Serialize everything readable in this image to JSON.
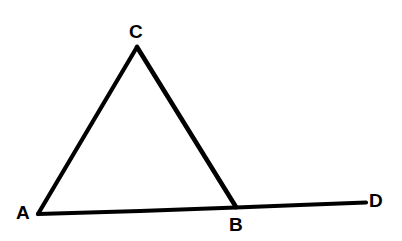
{
  "figure": {
    "background_color": "#ffffff",
    "stroke_color": "#000000",
    "stroke_width": 4,
    "width": 402,
    "height": 241
  },
  "labels": {
    "A": "A",
    "B": "B",
    "C": "C",
    "D": "D"
  },
  "geometry": {
    "points": [
      {
        "name": "A",
        "x": 38,
        "y": 214,
        "label_x": 24,
        "label_y": 212
      },
      {
        "name": "C",
        "x": 137,
        "y": 47,
        "label_x": 136,
        "label_y": 31
      },
      {
        "name": "B",
        "x": 236,
        "y": 207,
        "label_x": 236,
        "label_y": 224
      },
      {
        "name": "D",
        "x": 366,
        "y": 203,
        "label_x": 376,
        "label_y": 200
      }
    ],
    "segments": [
      {
        "name": "AC",
        "from": "A",
        "to": "C"
      },
      {
        "name": "CB",
        "from": "C",
        "to": "B"
      },
      {
        "name": "AB",
        "from": "A",
        "to": "B"
      },
      {
        "name": "BD",
        "from": "B",
        "to": "D"
      }
    ]
  }
}
